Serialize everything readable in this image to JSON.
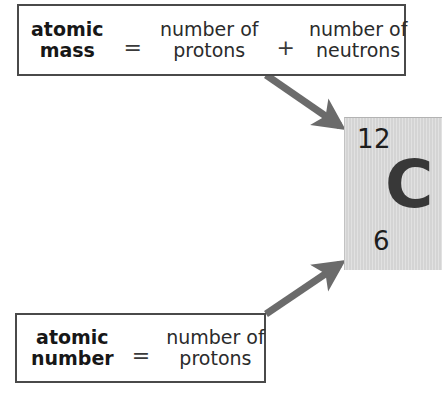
{
  "diagram": {
    "arrow_color": "#6b6b6b",
    "box_border_color": "#4a4a4a",
    "tile_fill_color": "#d4d4d4"
  },
  "atomic_mass_equation": {
    "left_term_line1": "atomic",
    "left_term_line2": "mass",
    "operator_equals": "=",
    "middle_term_line1": "number of",
    "middle_term_line2": "protons",
    "operator_plus": "+",
    "right_term_line1": "number of",
    "right_term_line2": "neutrons"
  },
  "atomic_number_equation": {
    "left_term_line1": "atomic",
    "left_term_line2": "number",
    "operator_equals": "=",
    "right_term_line1": "number of",
    "right_term_line2": "protons"
  },
  "element_tile": {
    "mass_number": "12",
    "symbol": "C",
    "atomic_number": "6"
  }
}
